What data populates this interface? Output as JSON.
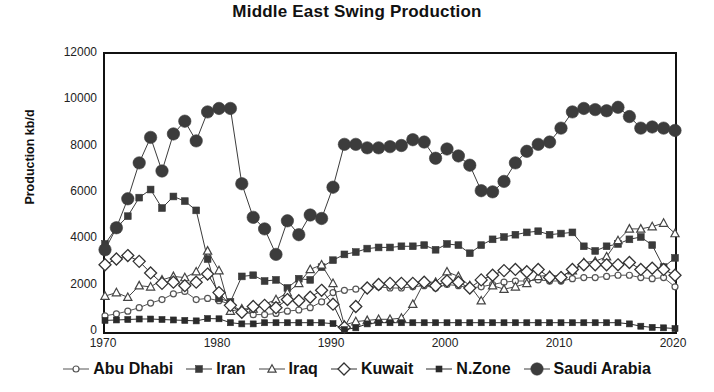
{
  "chart_data": {
    "type": "line",
    "title": "Middle East Swing Production",
    "xlabel": "",
    "ylabel": "Production kb/d",
    "xlim": [
      1970,
      2020
    ],
    "ylim": [
      0,
      12000
    ],
    "xticks": [
      "1970",
      "1980",
      "1990",
      "2000",
      "2010",
      "2020"
    ],
    "yticks": [
      "0",
      "2000",
      "4000",
      "6000",
      "8000",
      "10000",
      "12000"
    ],
    "grid": false,
    "legend_position": "bottom",
    "x": [
      1970,
      1971,
      1972,
      1973,
      1974,
      1975,
      1976,
      1977,
      1978,
      1979,
      1980,
      1981,
      1982,
      1983,
      1984,
      1985,
      1986,
      1987,
      1988,
      1989,
      1990,
      1991,
      1992,
      1993,
      1994,
      1995,
      1996,
      1997,
      1998,
      1999,
      2000,
      2001,
      2002,
      2003,
      2004,
      2005,
      2006,
      2007,
      2008,
      2009,
      2010,
      2011,
      2012,
      2013,
      2014,
      2015,
      2016,
      2017,
      2018,
      2019,
      2020
    ],
    "series": [
      {
        "name": "Abu Dhabi",
        "marker": "open-circle",
        "color": "#555555",
        "values": [
          700,
          780,
          900,
          1050,
          1250,
          1400,
          1650,
          1750,
          1400,
          1450,
          1350,
          1200,
          900,
          750,
          750,
          800,
          900,
          950,
          1050,
          1300,
          1700,
          1800,
          1850,
          1900,
          1950,
          1900,
          1900,
          1950,
          2000,
          1900,
          2050,
          2000,
          1900,
          1950,
          2050,
          2150,
          2200,
          2200,
          2250,
          2200,
          2200,
          2300,
          2350,
          2350,
          2400,
          2450,
          2450,
          2350,
          2300,
          2350,
          1950
        ]
      },
      {
        "name": "Iran",
        "marker": "filled-square",
        "color": "#3a3a3a",
        "values": [
          3800,
          4500,
          5000,
          5800,
          6150,
          5350,
          5850,
          5650,
          5250,
          3150,
          1450,
          1300,
          2400,
          2450,
          2200,
          2250,
          1900,
          2300,
          2250,
          2800,
          3100,
          3350,
          3450,
          3600,
          3650,
          3650,
          3700,
          3700,
          3750,
          3550,
          3800,
          3750,
          3400,
          3750,
          4000,
          4100,
          4200,
          4300,
          4350,
          4200,
          4250,
          4300,
          3700,
          3500,
          3700,
          3800,
          4000,
          4100,
          3750,
          2800,
          3200
        ]
      },
      {
        "name": "Iraq",
        "marker": "open-triangle",
        "color": "#444444",
        "values": [
          1550,
          1700,
          1500,
          2000,
          1950,
          2250,
          2400,
          2350,
          2600,
          3500,
          2650,
          900,
          1000,
          1000,
          1200,
          1400,
          1700,
          2100,
          2700,
          2900,
          2100,
          300,
          450,
          500,
          550,
          550,
          600,
          1200,
          2150,
          2150,
          2600,
          2400,
          2000,
          1350,
          2000,
          1850,
          1950,
          2100,
          2400,
          2450,
          2400,
          2650,
          3000,
          3050,
          3250,
          3950,
          4450,
          4450,
          4550,
          4700,
          4250
        ]
      },
      {
        "name": "Kuwait",
        "marker": "open-diamond",
        "color": "#333333",
        "values": [
          2900,
          3150,
          3300,
          3050,
          2550,
          2100,
          2150,
          2000,
          2150,
          2500,
          1700,
          1150,
          850,
          1100,
          1150,
          1050,
          1400,
          1350,
          1500,
          1800,
          1200,
          200,
          1100,
          1900,
          2050,
          2100,
          2100,
          2100,
          2150,
          2000,
          2200,
          2150,
          1900,
          2250,
          2450,
          2650,
          2700,
          2600,
          2700,
          2350,
          2350,
          2700,
          2900,
          2900,
          2900,
          2900,
          3000,
          2700,
          2750,
          2700,
          2450
        ]
      },
      {
        "name": "N.Zone",
        "marker": "filled-square-small",
        "color": "#2b2b2b",
        "values": [
          500,
          520,
          540,
          560,
          560,
          540,
          520,
          500,
          480,
          580,
          570,
          400,
          350,
          350,
          400,
          400,
          400,
          400,
          400,
          400,
          360,
          100,
          180,
          350,
          400,
          400,
          400,
          400,
          400,
          400,
          400,
          400,
          400,
          400,
          400,
          400,
          400,
          400,
          400,
          400,
          400,
          400,
          400,
          400,
          400,
          400,
          350,
          250,
          200,
          180,
          150
        ]
      },
      {
        "name": "Saudi Arabia",
        "marker": "filled-circle",
        "color": "#3c3c3c",
        "values": [
          3550,
          4500,
          5750,
          7300,
          8400,
          6950,
          8550,
          9100,
          8250,
          9500,
          9650,
          9650,
          6400,
          4950,
          4450,
          3350,
          4800,
          4200,
          5050,
          4900,
          6250,
          8100,
          8100,
          7950,
          7950,
          8000,
          8050,
          8300,
          8200,
          7500,
          7900,
          7600,
          7200,
          6100,
          6050,
          6500,
          7300,
          7800,
          8100,
          8200,
          8800,
          9500,
          9650,
          9600,
          9550,
          9700,
          9300,
          8800,
          8850,
          8800,
          8700
        ]
      }
    ]
  }
}
